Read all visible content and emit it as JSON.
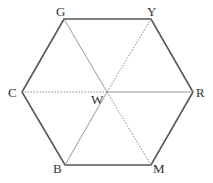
{
  "diagram": {
    "type": "hexagon-color-wheel",
    "center": {
      "label": "W",
      "x": 107,
      "y": 92,
      "label_x": 91,
      "label_y": 104
    },
    "vertices": [
      {
        "id": "G",
        "label": "G",
        "x": 64,
        "y": 19,
        "label_x": 56,
        "label_y": 16
      },
      {
        "id": "Y",
        "label": "Y",
        "x": 151,
        "y": 19,
        "label_x": 147,
        "label_y": 16
      },
      {
        "id": "R",
        "label": "R",
        "x": 193,
        "y": 92,
        "label_x": 196,
        "label_y": 97
      },
      {
        "id": "M",
        "label": "M",
        "x": 151,
        "y": 165,
        "label_x": 153,
        "label_y": 173
      },
      {
        "id": "B",
        "label": "B",
        "x": 65,
        "y": 165,
        "label_x": 53,
        "label_y": 173
      },
      {
        "id": "C",
        "label": "C",
        "x": 22,
        "y": 92,
        "label_x": 8,
        "label_y": 97
      }
    ],
    "spokes": [
      {
        "from": "W",
        "to": "G",
        "style": "solid"
      },
      {
        "from": "W",
        "to": "Y",
        "style": "dotted"
      },
      {
        "from": "W",
        "to": "R",
        "style": "solid"
      },
      {
        "from": "W",
        "to": "M",
        "style": "dotted"
      },
      {
        "from": "W",
        "to": "B",
        "style": "solid"
      },
      {
        "from": "W",
        "to": "C",
        "style": "dotted"
      }
    ]
  }
}
